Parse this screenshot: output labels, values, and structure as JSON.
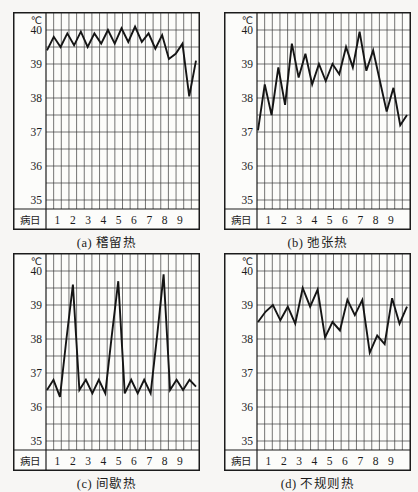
{
  "page": {
    "background": "#f7f6f4"
  },
  "colors": {
    "curve": "#151515",
    "grid": "#3a3a3a",
    "border": "#1c1c1c",
    "text": "#1b1b1b",
    "chart_background": "#fcfcfa"
  },
  "chart_data": [
    {
      "id": "a",
      "type": "line",
      "caption": "(a) 稽留热",
      "fever_type": "稽留热",
      "unit_label": "℃",
      "xlabel": "病日",
      "y_ticks": [
        "40",
        "39",
        "38",
        "37",
        "36",
        "35"
      ],
      "x_ticks": [
        "1",
        "2",
        "3",
        "4",
        "5",
        "6",
        "7",
        "8",
        "9"
      ],
      "ylim": [
        34.75,
        40.5
      ],
      "grid_step_c": 0.5,
      "readings_per_day": 2,
      "values": [
        39.4,
        39.8,
        39.5,
        39.9,
        39.55,
        39.95,
        39.5,
        39.9,
        39.6,
        40.0,
        39.6,
        40.05,
        39.65,
        40.1,
        39.65,
        39.9,
        39.45,
        39.85,
        39.15,
        39.3,
        39.6,
        38.05,
        39.1
      ]
    },
    {
      "id": "b",
      "type": "line",
      "caption": "(b) 弛张热",
      "fever_type": "弛张热",
      "unit_label": "℃",
      "xlabel": "病日",
      "y_ticks": [
        "40",
        "39",
        "38",
        "37",
        "36",
        "35"
      ],
      "x_ticks": [
        "1",
        "2",
        "3",
        "4",
        "5",
        "6",
        "7",
        "8",
        "9"
      ],
      "ylim": [
        34.75,
        40.5
      ],
      "grid_step_c": 0.5,
      "readings_per_day": 2,
      "values": [
        37.05,
        38.4,
        37.5,
        38.9,
        37.8,
        39.6,
        38.6,
        39.3,
        38.4,
        39.0,
        38.5,
        39.0,
        38.7,
        39.5,
        38.9,
        39.95,
        38.8,
        39.4,
        38.5,
        37.6,
        38.3,
        37.2,
        37.5
      ]
    },
    {
      "id": "c",
      "type": "line",
      "caption": "(c) 间歇热",
      "fever_type": "间歇热",
      "unit_label": "℃",
      "xlabel": "病日",
      "y_ticks": [
        "40",
        "39",
        "38",
        "37",
        "36",
        "35"
      ],
      "x_ticks": [
        "1",
        "2",
        "3",
        "4",
        "5",
        "6",
        "7",
        "8",
        "9"
      ],
      "ylim": [
        34.75,
        40.5
      ],
      "grid_step_c": 0.5,
      "readings_per_day": 2,
      "values": [
        36.5,
        36.8,
        36.3,
        38.0,
        39.6,
        36.5,
        36.8,
        36.4,
        36.8,
        36.4,
        38.1,
        39.7,
        36.4,
        36.8,
        36.4,
        36.8,
        36.4,
        38.1,
        39.9,
        36.5,
        36.8,
        36.5,
        36.8,
        36.6
      ]
    },
    {
      "id": "d",
      "type": "line",
      "caption": "(d) 不规则热",
      "fever_type": "不规则热",
      "unit_label": "℃",
      "xlabel": "病日",
      "y_ticks": [
        "40",
        "39",
        "38",
        "37",
        "36",
        "35"
      ],
      "x_ticks": [
        "1",
        "2",
        "3",
        "4",
        "5",
        "6",
        "7",
        "8",
        "9"
      ],
      "ylim": [
        34.75,
        40.5
      ],
      "grid_step_c": 0.5,
      "readings_per_day": 2,
      "values": [
        38.5,
        38.8,
        39.0,
        38.55,
        38.95,
        38.45,
        39.5,
        38.95,
        39.45,
        38.05,
        38.5,
        38.25,
        39.15,
        38.7,
        39.15,
        37.6,
        38.1,
        37.85,
        39.2,
        38.45,
        38.95
      ]
    }
  ]
}
